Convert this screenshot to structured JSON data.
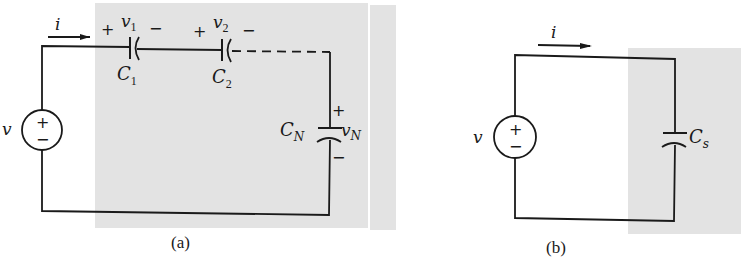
{
  "figure": {
    "panels": [
      {
        "id": "a",
        "caption": "(a)",
        "description": "Series connection of N capacitors driven by a voltage source",
        "source": {
          "label": "v",
          "plus": "+",
          "minus": "−"
        },
        "current": {
          "label": "i"
        },
        "capacitors": [
          {
            "name": "C",
            "sub": "1",
            "voltage": "v",
            "voltage_sub": "1",
            "plus": "+",
            "minus": "−"
          },
          {
            "name": "C",
            "sub": "2",
            "voltage": "v",
            "voltage_sub": "2",
            "plus": "+",
            "minus": "−"
          },
          {
            "name": "C",
            "sub": "N",
            "voltage": "v",
            "voltage_sub": "N",
            "plus": "+",
            "minus": "−"
          }
        ]
      },
      {
        "id": "b",
        "caption": "(b)",
        "description": "Equivalent circuit with single series capacitance",
        "source": {
          "label": "v",
          "plus": "+",
          "minus": "−"
        },
        "current": {
          "label": "i"
        },
        "capacitors": [
          {
            "name": "C",
            "sub": "s"
          }
        ]
      }
    ],
    "colors": {
      "shade": "#e3e3e3",
      "ink": "#1a1a1a",
      "background": "#ffffff"
    }
  }
}
